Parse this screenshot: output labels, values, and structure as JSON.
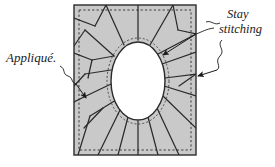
{
  "diagram": {
    "canvas": {
      "width": 275,
      "height": 167
    },
    "fabric": {
      "name": "fabric-square",
      "fill": "#c9c9c9",
      "stroke": "#2b2b2b",
      "x": 74,
      "y": 5,
      "width": 122,
      "height": 150
    },
    "stay_stitch_border": {
      "name": "stay-stitching-dashed-border",
      "color": "#3a3a3a",
      "inset": 5,
      "dash": "2,2"
    },
    "opening": {
      "name": "oval-opening",
      "fill": "#ffffff",
      "stroke": "#2b2b2b",
      "cx": 138,
      "cy": 81,
      "rx": 27,
      "ry": 39
    },
    "oval_stay_stitch": {
      "name": "oval-stay-stitching",
      "color": "#4a4a4a",
      "dash": "2,2",
      "offset": 4
    },
    "clip_lines": {
      "name": "clip-lines",
      "color": "#2b2b2b",
      "count": 24
    },
    "labels": [
      {
        "id": "applique",
        "text": "Appliqué.",
        "name": "label-applique",
        "x": 6,
        "y": 62,
        "side": "left"
      },
      {
        "id": "stay-stitching-1",
        "text": "Stay",
        "name": "label-stay",
        "x": 227,
        "y": 18,
        "side": "right"
      },
      {
        "id": "stay-stitching-2",
        "text": "stitching",
        "name": "label-stitching",
        "x": 219,
        "y": 33,
        "side": "right"
      }
    ],
    "leaders": [
      {
        "name": "leader-applique",
        "from": "Appliqué.",
        "to": "fabric-left-edge"
      },
      {
        "name": "leader-stay-to-oval",
        "from": "Stay stitching",
        "to": "oval-stay-stitching"
      },
      {
        "name": "leader-stay-to-border",
        "from": "Stay stitching",
        "to": "fabric-right-edge"
      }
    ]
  }
}
